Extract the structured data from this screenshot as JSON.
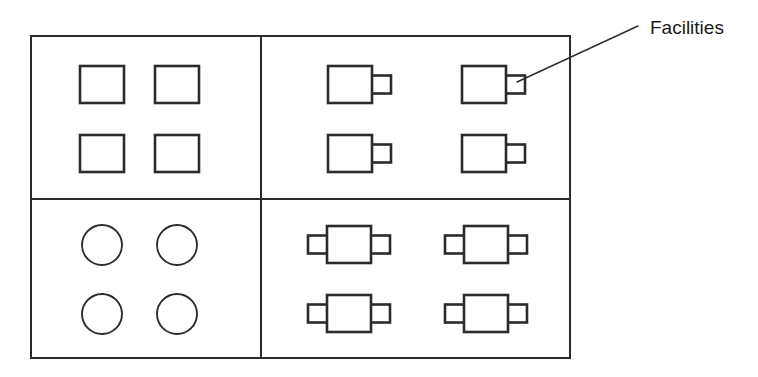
{
  "diagram": {
    "background_color": "#ffffff",
    "stroke_color": "#2b2b2b",
    "frame": {
      "name": "outer-frame",
      "x": 31,
      "y": 36,
      "width": 539,
      "height": 322,
      "stroke_width": 2
    },
    "dividers": {
      "vertical_x": 261,
      "horizontal_y": 199,
      "stroke_width": 2
    },
    "annotation": {
      "label": "Facilities",
      "text_x": 650,
      "text_y": 34,
      "font_size": 19,
      "leader_line": {
        "x1": 638,
        "y1": 26,
        "x2": 517,
        "y2": 82,
        "stroke_width": 1.4
      }
    },
    "quadrants": [
      {
        "name": "top-left-quadrant",
        "shape_type": "plain-rectangle",
        "count": 4,
        "description": "Four plain rectangles"
      },
      {
        "name": "top-right-quadrant",
        "shape_type": "rectangle-with-right-tab",
        "count": 4,
        "description": "Four rectangles each with one tab on the right"
      },
      {
        "name": "bottom-left-quadrant",
        "shape_type": "circle",
        "count": 4,
        "description": "Four circles"
      },
      {
        "name": "bottom-right-quadrant",
        "shape_type": "rectangle-with-two-tabs",
        "count": 4,
        "description": "Four rectangles each with a tab on the left and right"
      }
    ],
    "shapes": {
      "plain_rectangles": [
        {
          "name": "plain-rectangle-r1c1",
          "x": 80,
          "y": 66,
          "width": 44,
          "height": 37
        },
        {
          "name": "plain-rectangle-r1c2",
          "x": 155,
          "y": 66,
          "width": 44,
          "height": 37
        },
        {
          "name": "plain-rectangle-r2c1",
          "x": 80,
          "y": 135,
          "width": 44,
          "height": 37
        },
        {
          "name": "plain-rectangle-r2c2",
          "x": 155,
          "y": 135,
          "width": 44,
          "height": 37
        }
      ],
      "right_tab_rectangles": [
        {
          "name": "right-tab-rectangle-r1c1",
          "x": 328,
          "y": 66,
          "width": 44,
          "height": 37,
          "tab_width": 21,
          "tab_height": 18
        },
        {
          "name": "right-tab-rectangle-r1c2",
          "x": 462,
          "y": 66,
          "width": 44,
          "height": 37,
          "tab_width": 21,
          "tab_height": 18
        },
        {
          "name": "right-tab-rectangle-r2c1",
          "x": 328,
          "y": 135,
          "width": 44,
          "height": 37,
          "tab_width": 21,
          "tab_height": 18
        },
        {
          "name": "right-tab-rectangle-r2c2",
          "x": 462,
          "y": 135,
          "width": 44,
          "height": 37,
          "tab_width": 21,
          "tab_height": 18
        }
      ],
      "circles": [
        {
          "name": "circle-r1c1",
          "cx": 102,
          "cy": 245,
          "r": 20
        },
        {
          "name": "circle-r1c2",
          "cx": 177,
          "cy": 245,
          "r": 20
        },
        {
          "name": "circle-r2c1",
          "cx": 102,
          "cy": 314,
          "r": 20
        },
        {
          "name": "circle-r2c2",
          "cx": 177,
          "cy": 314,
          "r": 20
        }
      ],
      "double_tab_rectangles": [
        {
          "name": "double-tab-rectangle-r1c1",
          "x": 327,
          "y": 226,
          "width": 44,
          "height": 37,
          "tab_width": 21,
          "tab_height": 18
        },
        {
          "name": "double-tab-rectangle-r1c2",
          "x": 464,
          "y": 226,
          "width": 44,
          "height": 37,
          "tab_width": 21,
          "tab_height": 18
        },
        {
          "name": "double-tab-rectangle-r2c1",
          "x": 327,
          "y": 295,
          "width": 44,
          "height": 37,
          "tab_width": 21,
          "tab_height": 18
        },
        {
          "name": "double-tab-rectangle-r2c2",
          "x": 464,
          "y": 295,
          "width": 44,
          "height": 37,
          "tab_width": 21,
          "tab_height": 18
        }
      ]
    }
  }
}
